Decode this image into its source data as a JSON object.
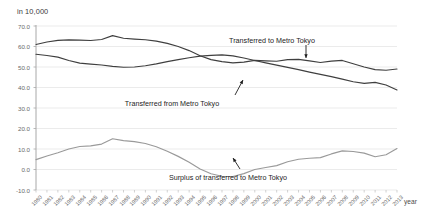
{
  "chart_data": {
    "type": "line",
    "title": "",
    "ylabel": "in 10,000",
    "xlabel": "year",
    "ylim": [
      -10.0,
      70.0
    ],
    "yticks": [
      "70.0",
      "60.0",
      "50.0",
      "40.0",
      "30.0",
      "20.0",
      "10.0",
      "0.0",
      "-10.0"
    ],
    "ytick_values": [
      70.0,
      60.0,
      50.0,
      40.0,
      30.0,
      20.0,
      10.0,
      0.0,
      -10.0
    ],
    "grid": true,
    "legend": "annotations",
    "categories": [
      "1980",
      "1981",
      "1982",
      "1983",
      "1984",
      "1985",
      "1986",
      "1987",
      "1988",
      "1989",
      "1990",
      "1991",
      "1992",
      "1993",
      "1994",
      "1995",
      "1996",
      "1997",
      "1998",
      "1999",
      "2000",
      "2001",
      "2002",
      "2003",
      "2004",
      "2005",
      "2006",
      "2007",
      "2008",
      "2009",
      "2010",
      "2011",
      "2012",
      "2013"
    ],
    "series": [
      {
        "name": "Transferred to Metro Tokyo",
        "color": "#3f3f3f",
        "values": [
          61.0,
          62.2,
          63.0,
          63.2,
          63.1,
          62.9,
          63.4,
          65.3,
          64.0,
          63.6,
          63.3,
          62.6,
          61.5,
          60.0,
          58.0,
          55.5,
          53.6,
          52.6,
          52.0,
          52.4,
          53.2,
          53.0,
          52.8,
          53.6,
          53.7,
          53.0,
          52.2,
          52.9,
          53.2,
          51.6,
          50.0,
          48.7,
          48.4,
          49.0
        ]
      },
      {
        "name": "Transferred from Metro Tokyo",
        "color": "#3f3f3f",
        "values": [
          56.2,
          55.6,
          54.8,
          53.2,
          51.9,
          51.4,
          51.0,
          50.3,
          49.9,
          50.0,
          50.6,
          51.5,
          52.6,
          53.6,
          54.5,
          55.3,
          55.7,
          55.9,
          55.4,
          54.4,
          53.2,
          52.0,
          50.9,
          49.8,
          48.7,
          47.5,
          46.4,
          45.3,
          44.1,
          42.8,
          42.0,
          42.5,
          41.2,
          38.8
        ]
      },
      {
        "name": "Surplus of transferred to Metro Tokyo",
        "color": "#9a9a9a",
        "values": [
          4.8,
          6.6,
          8.2,
          10.0,
          11.2,
          11.5,
          12.4,
          15.0,
          14.1,
          13.6,
          12.7,
          11.1,
          8.9,
          6.4,
          3.5,
          0.2,
          -2.1,
          -3.3,
          -3.4,
          -2.0,
          0.0,
          1.0,
          1.9,
          3.8,
          5.0,
          5.5,
          5.8,
          7.6,
          9.1,
          8.8,
          8.0,
          6.2,
          7.2,
          10.2
        ]
      }
    ],
    "annotations": [
      {
        "text": "Transferred to Metro Tokyo",
        "x": 272,
        "y": 36
      },
      {
        "text": "Transferred from Metro Tokyo",
        "x": 172,
        "y": 99
      },
      {
        "text": "Surplus of transferred to Metro Tokyo",
        "x": 228,
        "y": 173
      }
    ]
  }
}
